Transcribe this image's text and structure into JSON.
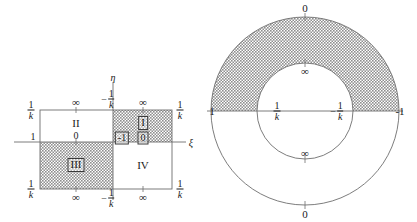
{
  "figure": {
    "colors": {
      "shade": "#9a9a9a",
      "line": "#6b6b6b",
      "text": "#1a1a1a",
      "background": "#ffffff"
    },
    "left_diagram": {
      "name": "rectangle-quadrants",
      "axes": {
        "x_axis_label": "ξ",
        "y_axis_label": "η"
      },
      "quadrants": [
        {
          "id": "I",
          "label": "I",
          "shaded": true,
          "boxed": true
        },
        {
          "id": "II",
          "label": "II",
          "shaded": false,
          "boxed": false
        },
        {
          "id": "III",
          "label": "III",
          "shaded": true,
          "boxed": true
        },
        {
          "id": "IV",
          "label": "IV",
          "shaded": false,
          "boxed": false
        }
      ],
      "center_labels": [
        {
          "name": "center-minus-one",
          "value": "-1",
          "boxed": true
        },
        {
          "name": "center-zero",
          "value": "0",
          "boxed": true
        }
      ],
      "corner_labels": {
        "top_left": {
          "num": "1",
          "den": "k",
          "sign": ""
        },
        "top_right": {
          "num": "1",
          "den": "k",
          "sign": ""
        },
        "bottom_left": {
          "num": "1",
          "den": "k",
          "sign": ""
        },
        "bottom_right": {
          "num": "1",
          "den": "k",
          "sign": ""
        }
      },
      "edge_labels": {
        "top_left_mid": "∞",
        "top_right_mid": "∞",
        "bottom_left_mid": "∞",
        "bottom_right_mid": "∞",
        "left_axis": "1",
        "left_inner": "0",
        "top_center": {
          "num": "1",
          "den": "k",
          "sign": "−"
        },
        "bottom_center": {
          "num": "1",
          "den": "k",
          "sign": "−"
        }
      }
    },
    "right_diagram": {
      "name": "annulus",
      "shaded_half": "upper",
      "labels": {
        "outer_top": "0",
        "outer_bottom": "0",
        "outer_left": "1",
        "outer_right": "-1",
        "inner_top": "∞",
        "inner_bottom": "∞",
        "inner_left": {
          "num": "1",
          "den": "k",
          "sign": ""
        },
        "inner_right": {
          "num": "1",
          "den": "k",
          "sign": "−"
        }
      }
    }
  }
}
